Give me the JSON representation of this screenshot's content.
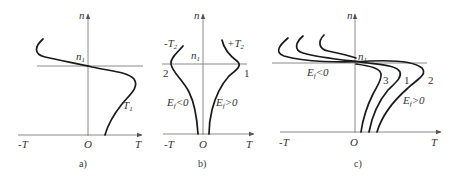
{
  "figure": {
    "panels": [
      {
        "id": "a",
        "caption": "a)",
        "y_axis_label": "n",
        "x_axis_labels": {
          "left": "-T",
          "origin": "O",
          "right": "T"
        },
        "reference_line_label": "n",
        "reference_line_sub": "1",
        "curves": [
          {
            "label": "T",
            "label_sub": "1"
          }
        ]
      },
      {
        "id": "b",
        "caption": "b)",
        "y_axis_label": "n",
        "x_axis_labels": {
          "left": "-T",
          "origin": "O",
          "right": "T"
        },
        "reference_line_label": "n",
        "reference_line_sub": "1",
        "curves": [
          {
            "label": "-T",
            "label_sub": "2",
            "number": "2",
            "condition_main": "E",
            "condition_sub": "f",
            "condition_rel": "<0"
          },
          {
            "label": "+T",
            "label_sub": "2",
            "number": "1",
            "condition_main": "E",
            "condition_sub": "f",
            "condition_rel": ">0"
          }
        ]
      },
      {
        "id": "c",
        "caption": "c)",
        "y_axis_label": "n",
        "x_axis_labels": {
          "left": "-T",
          "origin": "O",
          "right": "T"
        },
        "reference_line_label": "n",
        "reference_line_sub": "1",
        "curves": [
          {
            "number": "3"
          },
          {
            "number": "1"
          },
          {
            "number": "2"
          }
        ],
        "conditions": [
          {
            "main": "E",
            "sub": "f",
            "rel": "<0"
          },
          {
            "main": "E",
            "sub": "f",
            "rel": ">0"
          }
        ]
      }
    ]
  }
}
